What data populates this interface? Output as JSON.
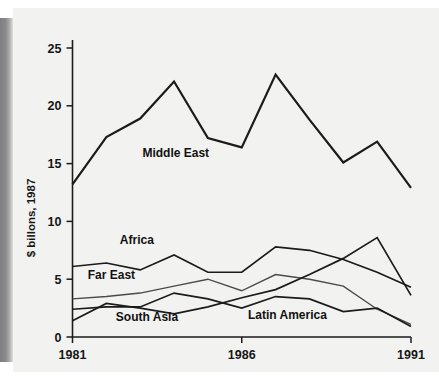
{
  "chart_data": {
    "type": "line",
    "title": "",
    "xlabel": "",
    "ylabel": "$ billons, 1987",
    "x": [
      1981,
      1982,
      1983,
      1984,
      1985,
      1986,
      1987,
      1988,
      1989,
      1990,
      1991
    ],
    "xlim": [
      1981,
      1991
    ],
    "ylim": [
      0,
      26
    ],
    "ytick_labels": [
      "0",
      "5",
      "10",
      "15",
      "20",
      "25"
    ],
    "ytick_values": [
      0,
      5,
      10,
      15,
      20,
      25
    ],
    "xtick_labels": [
      "1981",
      "1986",
      "1991"
    ],
    "xtick_values": [
      1981,
      1986,
      1991
    ],
    "grid": false,
    "legend": "inline-labels",
    "series": [
      {
        "name": "Middle East",
        "label": "Middle East",
        "color": "#1b1b1b",
        "weight": "thick",
        "values": [
          13.2,
          17.3,
          18.9,
          22.1,
          17.2,
          16.4,
          22.7,
          18.8,
          15.1,
          16.9,
          12.9
        ]
      },
      {
        "name": "Africa",
        "label": "Africa",
        "color": "#1b1b1b",
        "weight": "med",
        "values": [
          6.1,
          6.4,
          5.8,
          7.1,
          5.6,
          5.6,
          7.8,
          7.5,
          6.7,
          5.6,
          4.3
        ]
      },
      {
        "name": "Far East",
        "label": "Far East",
        "color": "#4a4a4a",
        "weight": "thin",
        "values": [
          3.3,
          3.5,
          3.8,
          4.4,
          5.0,
          4.0,
          5.4,
          5.0,
          4.4,
          2.4,
          1.1
        ]
      },
      {
        "name": "South Asia",
        "label": "South Asia",
        "color": "#1b1b1b",
        "weight": "med",
        "values": [
          1.4,
          2.9,
          2.5,
          2.0,
          2.6,
          3.4,
          4.1,
          5.4,
          6.8,
          8.6,
          3.6
        ]
      },
      {
        "name": "Latin America",
        "label": "Latin America",
        "color": "#1b1b1b",
        "weight": "med",
        "values": [
          2.4,
          2.6,
          2.6,
          3.8,
          3.3,
          2.5,
          3.5,
          3.3,
          2.2,
          2.5,
          0.9
        ]
      }
    ],
    "series_label_positions": [
      {
        "name": "Middle East",
        "x": 1984.05,
        "y": 15.6,
        "anchor": "middle"
      },
      {
        "name": "Africa",
        "x": 1982.9,
        "y": 8.05,
        "anchor": "middle"
      },
      {
        "name": "Far East",
        "x": 1982.15,
        "y": 5.05,
        "anchor": "middle"
      },
      {
        "name": "South Asia",
        "x": 1983.2,
        "y": 1.35,
        "anchor": "middle"
      },
      {
        "name": "Latin America",
        "x": 1987.35,
        "y": 1.55,
        "anchor": "middle"
      }
    ]
  }
}
